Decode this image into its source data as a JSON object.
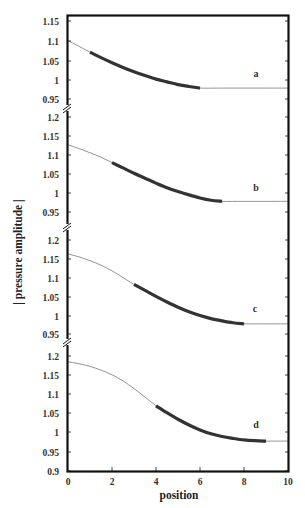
{
  "chart_data": {
    "type": "line",
    "title": "",
    "xlabel": "position",
    "ylabel": "| pressure amplitude |",
    "xlim": [
      0,
      10
    ],
    "x_ticks": [
      0,
      2,
      4,
      6,
      8,
      10
    ],
    "grid": false,
    "legend": "none (panels labeled a–d at right)",
    "layout": "four vertically stacked panels sharing x axis, separated by axis-break marks",
    "panels": [
      {
        "label": "a",
        "ylim": [
          0.93,
          1.165
        ],
        "y_ticks": [
          0.95,
          1,
          1.05,
          1.1,
          1.15
        ],
        "tick_px": [
          99,
          80,
          61,
          41,
          21
        ],
        "thick_segment": [
          1,
          6
        ],
        "x": [
          0,
          0.5,
          1,
          1.5,
          2,
          2.5,
          3,
          3.5,
          4,
          4.5,
          5,
          5.5,
          6,
          7,
          8,
          9,
          10
        ],
        "values": [
          1.1,
          1.085,
          1.07,
          1.056,
          1.043,
          1.031,
          1.02,
          1.01,
          1.001,
          0.994,
          0.987,
          0.982,
          0.978,
          0.978,
          0.978,
          0.978,
          0.978
        ]
      },
      {
        "label": "b",
        "ylim": [
          0.93,
          1.225
        ],
        "y_ticks": [
          0.95,
          1,
          1.05,
          1.1,
          1.15,
          1.2
        ],
        "tick_px": [
          212,
          193,
          174,
          155,
          136,
          117
        ],
        "thick_segment": [
          2,
          7
        ],
        "x": [
          0,
          0.5,
          1,
          1.5,
          2,
          2.5,
          3,
          3.5,
          4,
          4.5,
          5,
          5.5,
          6,
          6.5,
          7,
          8,
          9,
          10
        ],
        "values": [
          1.127,
          1.117,
          1.106,
          1.094,
          1.08,
          1.066,
          1.052,
          1.039,
          1.026,
          1.014,
          1.004,
          0.995,
          0.987,
          0.981,
          0.978,
          0.978,
          0.978,
          0.978
        ]
      },
      {
        "label": "c",
        "ylim": [
          0.93,
          1.235
        ],
        "y_ticks": [
          0.95,
          1,
          1.05,
          1.1,
          1.15,
          1.2
        ],
        "tick_px": [
          334,
          316,
          297,
          278,
          259,
          240
        ],
        "thick_segment": [
          3,
          8
        ],
        "x": [
          0,
          0.5,
          1,
          1.5,
          2,
          2.5,
          3,
          3.5,
          4,
          4.5,
          5,
          5.5,
          6,
          6.5,
          7,
          7.5,
          8,
          9,
          10
        ],
        "values": [
          1.163,
          1.155,
          1.145,
          1.133,
          1.118,
          1.1,
          1.082,
          1.066,
          1.05,
          1.035,
          1.021,
          1.009,
          0.999,
          0.991,
          0.985,
          0.98,
          0.977,
          0.977,
          0.977
        ]
      },
      {
        "label": "d",
        "ylim": [
          0.9,
          1.235
        ],
        "y_ticks": [
          0.9,
          0.95,
          1,
          1.05,
          1.1,
          1.15,
          1.2
        ],
        "tick_px": [
          471,
          452,
          432,
          413,
          394,
          375,
          356
        ],
        "thick_segment": [
          4,
          9
        ],
        "x": [
          0,
          0.5,
          1,
          1.5,
          2,
          2.5,
          3,
          3.5,
          4,
          4.5,
          5,
          5.5,
          6,
          6.5,
          7,
          7.5,
          8,
          8.5,
          9,
          10
        ],
        "values": [
          1.185,
          1.18,
          1.173,
          1.163,
          1.151,
          1.135,
          1.115,
          1.093,
          1.07,
          1.052,
          1.035,
          1.02,
          1.007,
          0.997,
          0.99,
          0.985,
          0.981,
          0.979,
          0.978,
          0.978
        ]
      }
    ]
  },
  "labels": {
    "xlabel": "position",
    "ylabel": "| pressure amplitude |",
    "panel_a": "a",
    "panel_b": "b",
    "panel_c": "c",
    "panel_d": "d",
    "x_ticks": [
      "0",
      "2",
      "4",
      "6",
      "8",
      "10"
    ],
    "panel_a_ticks": [
      "1.15",
      "1.1",
      "1.05",
      "1",
      "0.95"
    ],
    "panel_b_ticks": [
      "1.2",
      "1.15",
      "1.1",
      "1.05",
      "1",
      "0.95"
    ],
    "panel_c_ticks": [
      "1.2",
      "1.15",
      "1.1",
      "1.05",
      "1",
      "0.95"
    ],
    "panel_d_ticks": [
      "1.2",
      "1.15",
      "1.1",
      "1.05",
      "1",
      "0.95",
      "0.9"
    ]
  },
  "colors": {
    "axis": "#111111",
    "thin_curve": "#888888",
    "thick_curve": "#333333"
  }
}
